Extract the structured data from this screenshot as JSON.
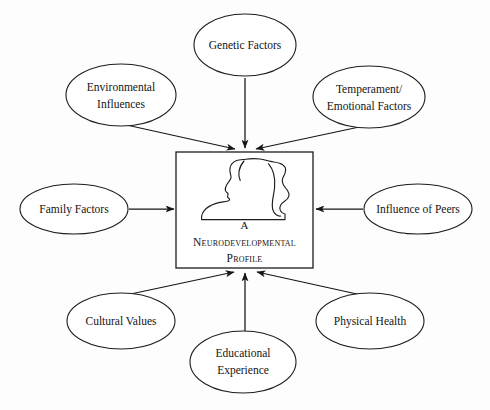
{
  "diagram": {
    "type": "concept-map",
    "title": "A Neurodevelopmental Profile",
    "center": {
      "line1": "A",
      "line2": "Neurodevelopmental",
      "line3": "Profile",
      "icon": "person-silhouette-icon"
    },
    "nodes": [
      {
        "id": "genetic-factors",
        "line1": "Genetic Factors",
        "line2": "",
        "position": "top-center"
      },
      {
        "id": "environmental-influences",
        "line1": "Environmental",
        "line2": "Influences",
        "position": "top-left"
      },
      {
        "id": "temperament-emotional",
        "line1": "Temperament/",
        "line2": "Emotional Factors",
        "position": "top-right"
      },
      {
        "id": "family-factors",
        "line1": "Family Factors",
        "line2": "",
        "position": "left"
      },
      {
        "id": "influence-of-peers",
        "line1": "Influence of Peers",
        "line2": "",
        "position": "right"
      },
      {
        "id": "cultural-values",
        "line1": "Cultural Values",
        "line2": "",
        "position": "bottom-left"
      },
      {
        "id": "educational-experience",
        "line1": "Educational",
        "line2": "Experience",
        "position": "bottom-center"
      },
      {
        "id": "physical-health",
        "line1": "Physical Health",
        "line2": "",
        "position": "bottom-right"
      }
    ],
    "colors": {
      "background": "#fdfdfd",
      "stroke": "#1d1d1d",
      "text": "#141414"
    }
  }
}
